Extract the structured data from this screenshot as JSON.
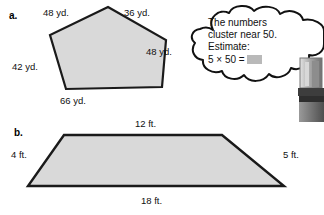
{
  "page": {
    "background_color": "#ffffff",
    "shape_fill": "#d9d9d9",
    "shape_stroke": "#1a1a1a",
    "answer_blank_color": "#b9b9b9"
  },
  "problems": [
    {
      "letter": "a.",
      "shape": "pentagon",
      "labels": [
        {
          "name": "top-left-side",
          "text": "48 yd."
        },
        {
          "name": "top-right-side",
          "text": "36 yd."
        },
        {
          "name": "right-side",
          "text": "48 yd."
        },
        {
          "name": "left-side",
          "text": "42 yd."
        },
        {
          "name": "bottom-side",
          "text": "66 yd."
        }
      ]
    },
    {
      "letter": "b.",
      "shape": "trapezoid",
      "labels": [
        {
          "name": "top-side",
          "text": "12 ft."
        },
        {
          "name": "left-side",
          "text": "4 ft."
        },
        {
          "name": "right-side",
          "text": "5 ft."
        },
        {
          "name": "bottom-side",
          "text": "18 ft."
        }
      ]
    }
  ],
  "thought_bubble": {
    "line1": "The numbers",
    "line2": "cluster near 50.",
    "line3": "Estimate:",
    "line4_prefix": "5 × 50 ="
  }
}
